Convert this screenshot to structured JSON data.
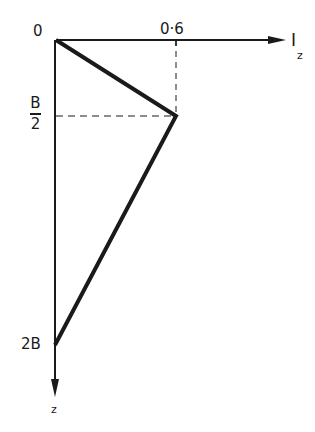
{
  "diagram": {
    "type": "influence-factor-profile",
    "axes": {
      "x": {
        "label_main": "I",
        "label_sub": "z",
        "tick_value_label": "0·6"
      },
      "y": {
        "label": "z",
        "origin_label": "0",
        "tick_labels": {
          "half_b_numerator": "B",
          "half_b_denominator": "2",
          "two_b": "2B"
        }
      }
    },
    "profile_points": [
      {
        "z": "0",
        "Iz": 0.0
      },
      {
        "z": "B/2",
        "Iz": 0.6
      },
      {
        "z": "2B",
        "Iz": 0.0
      }
    ],
    "colors": {
      "line": "#1a1a1a",
      "background": "#ffffff"
    }
  }
}
